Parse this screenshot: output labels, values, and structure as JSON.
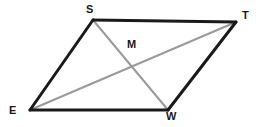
{
  "figure": {
    "name": "parallelogram-with-diagonals",
    "width": 259,
    "height": 127,
    "background_color": "#ffffff",
    "side_color": "#1a1a1a",
    "diagonal_color": "#9a9a9a",
    "label_color": "#1a1a1a",
    "side_stroke_width": 3,
    "diagonal_stroke_width": 2
  },
  "labels": {
    "s": "S",
    "t": "T",
    "m": "M",
    "e": "E",
    "w": "W"
  },
  "points": {
    "S": {
      "x": 93,
      "y": 20
    },
    "T": {
      "x": 236,
      "y": 22
    },
    "W": {
      "x": 168,
      "y": 110
    },
    "E": {
      "x": 30,
      "y": 110
    },
    "M": {
      "x": 133,
      "y": 68
    }
  },
  "edges": [
    {
      "name": "side-s-t",
      "from": "S",
      "to": "T",
      "kind": "side"
    },
    {
      "name": "side-t-w",
      "from": "T",
      "to": "W",
      "kind": "side"
    },
    {
      "name": "side-w-e",
      "from": "W",
      "to": "E",
      "kind": "side"
    },
    {
      "name": "side-e-s",
      "from": "E",
      "to": "S",
      "kind": "side"
    },
    {
      "name": "diagonal-s-w",
      "from": "S",
      "to": "W",
      "kind": "diagonal"
    },
    {
      "name": "diagonal-e-t",
      "from": "E",
      "to": "T",
      "kind": "diagonal"
    }
  ]
}
